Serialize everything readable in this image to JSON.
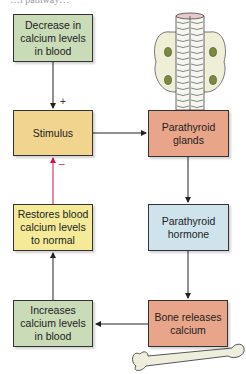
{
  "diagram": {
    "top_caption_fragment": "…l pathway…",
    "nodes": [
      {
        "id": "decrease",
        "label": "Decrease in calcium levels in blood",
        "color": "#c9dbb7"
      },
      {
        "id": "stimulus",
        "label": "Stimulus",
        "color": "#f1d58e"
      },
      {
        "id": "glands",
        "label": "Parathyroid glands",
        "color": "#e9a58a"
      },
      {
        "id": "hormone",
        "label": "Parathyroid hormone",
        "color": "#cfe3ec"
      },
      {
        "id": "bone",
        "label": "Bone releases calcium",
        "color": "#e9a58a"
      },
      {
        "id": "increases",
        "label": "Increases calcium levels in blood",
        "color": "#c9dbb7"
      },
      {
        "id": "restores",
        "label": "Restores blood calcium levels to normal",
        "color": "#f4ea98"
      }
    ],
    "edges": [
      {
        "from": "decrease",
        "to": "stimulus",
        "sign": "+",
        "color": "#222222"
      },
      {
        "from": "stimulus",
        "to": "glands",
        "color": "#222222"
      },
      {
        "from": "glands",
        "to": "hormone",
        "color": "#222222"
      },
      {
        "from": "hormone",
        "to": "bone",
        "color": "#222222"
      },
      {
        "from": "bone",
        "to": "increases",
        "color": "#222222"
      },
      {
        "from": "increases",
        "to": "restores",
        "color": "#222222"
      },
      {
        "from": "restores",
        "to": "stimulus",
        "sign": "–",
        "color": "#d0134f"
      }
    ],
    "signs": {
      "plus": "+",
      "minus": "–"
    },
    "illustrations": [
      "parathyroid-thyroid-trachea",
      "femur-bone"
    ]
  }
}
